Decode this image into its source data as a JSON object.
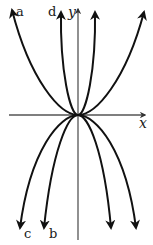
{
  "figure": {
    "axes": {
      "x_label": "x",
      "y_label": "y",
      "origin": [
        78,
        115
      ]
    },
    "curves": [
      {
        "id": "a",
        "label": "a",
        "direction": "up",
        "width": "wide",
        "label_side": "left"
      },
      {
        "id": "d",
        "label": "d",
        "direction": "up",
        "width": "narrow",
        "label_side": "left"
      },
      {
        "id": "c",
        "label": "c",
        "direction": "down",
        "width": "wide",
        "label_side": "left"
      },
      {
        "id": "b",
        "label": "b",
        "direction": "down",
        "width": "narrow",
        "label_side": "left"
      }
    ],
    "colors": {
      "curve": "#111111",
      "axis": "#555555",
      "background": "#ffffff"
    }
  }
}
